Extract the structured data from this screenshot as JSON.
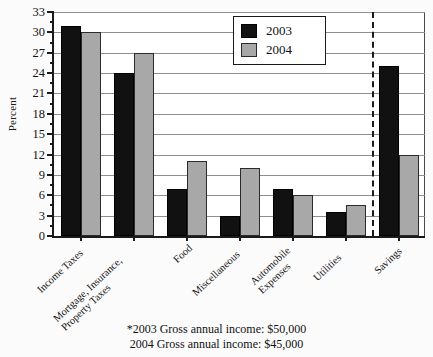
{
  "chart_data": {
    "type": "bar",
    "title": "",
    "xlabel": "",
    "ylabel": "Percent",
    "ylim": [
      0,
      33
    ],
    "ytick_step": 3,
    "yticks": [
      0,
      3,
      6,
      9,
      12,
      15,
      18,
      21,
      24,
      27,
      30,
      33
    ],
    "ytick_labels": [
      "0",
      "3",
      "6",
      "9",
      "12",
      "15",
      "18",
      "21",
      "24",
      "27",
      "30",
      "33"
    ],
    "minor_tick_step": 1.5,
    "grid": true,
    "grid_axis": "y",
    "legend_position": "top-center-right",
    "categories": [
      "Income Taxes",
      "Mortgage, Insurance, Property Taxes",
      "Food",
      "Miscellaneous",
      "Automobile Expenses",
      "Utilities",
      "Savings"
    ],
    "category_label_lines": [
      [
        "Income Taxes"
      ],
      [
        "Mortgage, Insurance,",
        "Property Taxes"
      ],
      [
        "Food"
      ],
      [
        "Miscellaneous"
      ],
      [
        "Automobile",
        "Expenses"
      ],
      [
        "Utilities"
      ],
      [
        "Savings"
      ]
    ],
    "series": [
      {
        "name": "2003",
        "color": "#111111",
        "values": [
          31,
          24,
          7,
          3,
          7,
          3.5,
          25
        ]
      },
      {
        "name": "2004",
        "color": "#a8a8a8",
        "values": [
          30,
          27,
          11,
          10,
          6,
          4.5,
          12
        ]
      }
    ],
    "annotations": [
      {
        "type": "vertical-dashed-line",
        "between_categories": [
          "Utilities",
          "Savings"
        ],
        "style": "dashed"
      }
    ]
  },
  "legend": {
    "entries": [
      {
        "label": "2003",
        "swatch": "black-square-icon"
      },
      {
        "label": "2004",
        "swatch": "gray-square-icon"
      }
    ]
  },
  "footnotes": {
    "line1": "*2003 Gross annual income:  $50,000",
    "line2": "2004 Gross annual income:  $45,000"
  }
}
